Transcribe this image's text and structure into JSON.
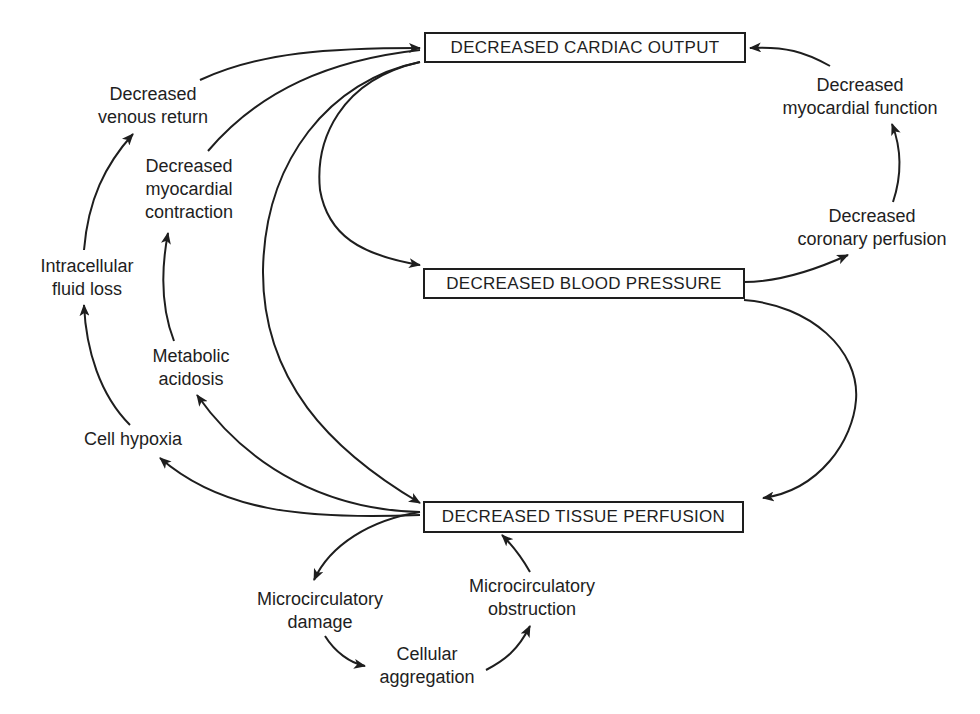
{
  "diagram": {
    "type": "causal-cycle",
    "nodes": {
      "cardiac_output": "DECREASED CARDIAC OUTPUT",
      "blood_pressure": "DECREASED BLOOD PRESSURE",
      "tissue_perfusion": "DECREASED TISSUE PERFUSION"
    },
    "labels": {
      "venous_return": [
        "Decreased",
        "venous return"
      ],
      "myocardial_contraction": [
        "Decreased",
        "myocardial",
        "contraction"
      ],
      "intracellular_fluid_loss": [
        "Intracellular",
        "fluid loss"
      ],
      "metabolic_acidosis": [
        "Metabolic",
        "acidosis"
      ],
      "cell_hypoxia": [
        "Cell hypoxia"
      ],
      "myocardial_function": [
        "Decreased",
        "myocardial function"
      ],
      "coronary_perfusion": [
        "Decreased",
        "coronary perfusion"
      ],
      "microcirculatory_damage": [
        "Microcirculatory",
        "damage"
      ],
      "cellular_aggregation": [
        "Cellular",
        "aggregation"
      ],
      "microcirculatory_obstruction": [
        "Microcirculatory",
        "obstruction"
      ]
    },
    "edges": [
      {
        "from": "DECREASED CARDIAC OUTPUT",
        "to": "DECREASED BLOOD PRESSURE"
      },
      {
        "from": "DECREASED BLOOD PRESSURE",
        "to": "DECREASED TISSUE PERFUSION"
      },
      {
        "from": "DECREASED CARDIAC OUTPUT",
        "to": "DECREASED TISSUE PERFUSION"
      },
      {
        "from": "DECREASED BLOOD PRESSURE",
        "to": "Decreased coronary perfusion"
      },
      {
        "from": "Decreased coronary perfusion",
        "to": "Decreased myocardial function"
      },
      {
        "from": "Decreased myocardial function",
        "to": "DECREASED CARDIAC OUTPUT"
      },
      {
        "from": "DECREASED TISSUE PERFUSION",
        "to": "Cell hypoxia"
      },
      {
        "from": "Cell hypoxia",
        "to": "Intracellular fluid loss"
      },
      {
        "from": "Intracellular fluid loss",
        "to": "Decreased venous return"
      },
      {
        "from": "Decreased venous return",
        "to": "DECREASED CARDIAC OUTPUT"
      },
      {
        "from": "DECREASED TISSUE PERFUSION",
        "to": "Metabolic acidosis"
      },
      {
        "from": "Metabolic acidosis",
        "to": "Decreased myocardial contraction"
      },
      {
        "from": "Decreased myocardial contraction",
        "to": "DECREASED CARDIAC OUTPUT"
      },
      {
        "from": "DECREASED TISSUE PERFUSION",
        "to": "Microcirculatory damage"
      },
      {
        "from": "Microcirculatory damage",
        "to": "Cellular aggregation"
      },
      {
        "from": "Cellular aggregation",
        "to": "Microcirculatory obstruction"
      },
      {
        "from": "Microcirculatory obstruction",
        "to": "DECREASED TISSUE PERFUSION"
      }
    ],
    "colors": {
      "ink": "#1e1e1e",
      "background": "#ffffff"
    }
  }
}
